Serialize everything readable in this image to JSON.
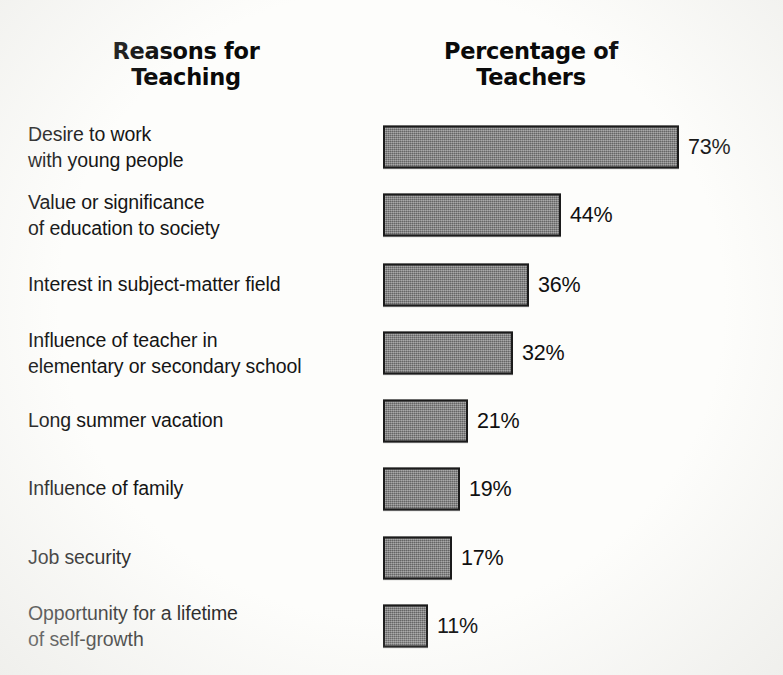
{
  "headers": {
    "left": {
      "line1": "Reasons for",
      "line2": "Teaching"
    },
    "right": {
      "line1": "Percentage of",
      "line2": "Teachers"
    }
  },
  "chart_data": {
    "type": "bar",
    "orientation": "horizontal",
    "title": "Reasons for Teaching",
    "xlabel": "Percentage of Teachers",
    "ylabel": "Reasons for Teaching",
    "grid": false,
    "legend": null,
    "xlim": [
      0,
      80
    ],
    "value_suffix": "%",
    "bar_fill_color": "#7d7d7d",
    "bar_border_color": "#1b1b1b",
    "background_color": "#fdfdfb",
    "categories": [
      "Desire to work\nwith young people",
      "Value or significance\nof education to society",
      "Interest in subject-matter field",
      "Influence of teacher in\nelementary or secondary school",
      "Long summer vacation",
      "Influence of family",
      "Job security",
      "Opportunity for a lifetime\nof self-growth"
    ],
    "values": [
      73,
      44,
      36,
      32,
      21,
      19,
      17,
      11
    ],
    "value_labels": [
      "73%",
      "44%",
      "36%",
      "32%",
      "21%",
      "19%",
      "17%",
      "11%"
    ]
  }
}
